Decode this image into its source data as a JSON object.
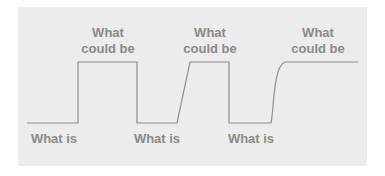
{
  "diagram": {
    "title": "",
    "colors": {
      "background": "#ececec",
      "line": "#8e8e8e",
      "text": "#8a8a8a"
    },
    "states": {
      "low": "What is",
      "high": "What could be"
    },
    "segments": [
      {
        "state": "low"
      },
      {
        "transition": "step"
      },
      {
        "state": "high"
      },
      {
        "transition": "step-down"
      },
      {
        "state": "low"
      },
      {
        "transition": "ramp"
      },
      {
        "state": "high"
      },
      {
        "transition": "step-down"
      },
      {
        "state": "low"
      },
      {
        "transition": "curve"
      },
      {
        "state": "high"
      }
    ],
    "labels": {
      "high_1": [
        "What",
        "could be"
      ],
      "high_2": [
        "What",
        "could be"
      ],
      "high_3": [
        "What",
        "could be"
      ],
      "low_1": "What is",
      "low_2": "What is",
      "low_3": "What is"
    }
  }
}
